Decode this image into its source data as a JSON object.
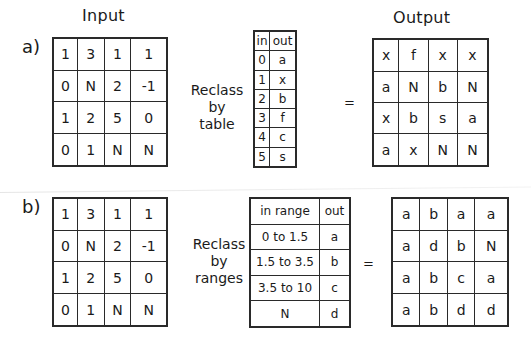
{
  "section_a": {
    "label": "a)",
    "input_title": "Input",
    "output_title": "Output",
    "operation": [
      "Reclass",
      "by",
      "table"
    ],
    "equals": "=",
    "input_grid": [
      [
        "1",
        "3",
        "1",
        "1"
      ],
      [
        "0",
        "N",
        "2",
        "-1"
      ],
      [
        "1",
        "2",
        "5",
        "0"
      ],
      [
        "0",
        "1",
        "N",
        "N"
      ]
    ],
    "lookup_table": {
      "headers": [
        "in",
        "out"
      ],
      "rows": [
        [
          "0",
          "a"
        ],
        [
          "1",
          "x"
        ],
        [
          "2",
          "b"
        ],
        [
          "3",
          "f"
        ],
        [
          "4",
          "c"
        ],
        [
          "5",
          "s"
        ]
      ]
    },
    "output_grid": [
      [
        "x",
        "f",
        "x",
        "x"
      ],
      [
        "a",
        "N",
        "b",
        "N"
      ],
      [
        "x",
        "b",
        "s",
        "a"
      ],
      [
        "a",
        "x",
        "N",
        "N"
      ]
    ]
  },
  "section_b": {
    "label": "b)",
    "operation": [
      "Reclass",
      "by",
      "ranges"
    ],
    "equals": "=",
    "input_grid": [
      [
        "1",
        "3",
        "1",
        "1"
      ],
      [
        "0",
        "N",
        "2",
        "-1"
      ],
      [
        "1",
        "2",
        "5",
        "0"
      ],
      [
        "0",
        "1",
        "N",
        "N"
      ]
    ],
    "range_table": {
      "headers": [
        "in range",
        "out"
      ],
      "rows": [
        [
          "0 to 1.5",
          "a"
        ],
        [
          "1.5 to 3.5",
          "b"
        ],
        [
          "3.5 to 10",
          "c"
        ],
        [
          "N",
          "d"
        ]
      ]
    },
    "output_grid": [
      [
        "a",
        "b",
        "a",
        "a"
      ],
      [
        "a",
        "d",
        "b",
        "N"
      ],
      [
        "a",
        "b",
        "c",
        "a"
      ],
      [
        "a",
        "b",
        "d",
        "d"
      ]
    ]
  }
}
